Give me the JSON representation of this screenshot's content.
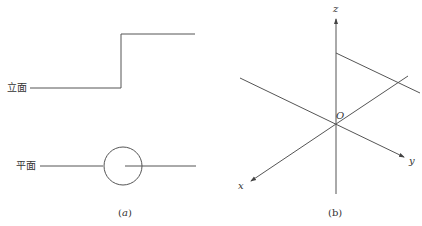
{
  "panel_a": {
    "elevation_label": "立面",
    "plan_label": "平面",
    "caption": "(a)"
  },
  "panel_b": {
    "axis_z": "z",
    "axis_x": "x",
    "axis_y": "y",
    "origin": "O",
    "caption": "(b)"
  },
  "colors": {
    "line": "#555555",
    "text": "#333333"
  }
}
